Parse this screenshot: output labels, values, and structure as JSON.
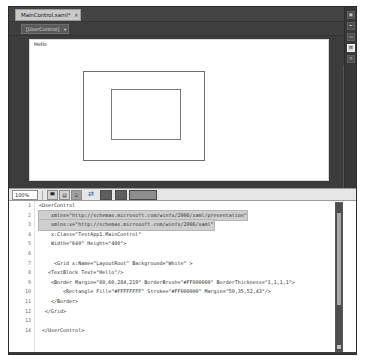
{
  "window": {
    "chrome_color": "#3c3c3c",
    "accent_color": "#1b5faa"
  },
  "tabstrip": {
    "tab_label": "MainControl.xaml*",
    "close_glyph": "✕"
  },
  "breadcrumb": {
    "root_label": "[UserControl]",
    "caret_glyph": "▾"
  },
  "designer": {
    "text_block_content": "Hello",
    "scroll_up_glyph": "▲",
    "scroll_down_glyph": "▼"
  },
  "rail": {
    "buttons": [
      {
        "name": "properties-icon",
        "glyph": "▣",
        "selected": false
      },
      {
        "name": "resources-icon",
        "glyph": "✒",
        "selected": false
      },
      {
        "name": "data-icon",
        "glyph": "▭",
        "selected": false
      },
      {
        "name": "assets-icon",
        "glyph": "⊞",
        "selected": true
      },
      {
        "name": "objects-icon",
        "glyph": "≡",
        "selected": false
      }
    ]
  },
  "splitbar": {
    "zoom_value": "100%",
    "design_button": "▀",
    "split_button": "▤",
    "code_button": "⌸",
    "swap_button": "⇄",
    "orientation_button": "▥"
  },
  "code": {
    "lines": [
      {
        "n": "1",
        "text": "<UserControl",
        "selected": false
      },
      {
        "n": "2",
        "text": "    xmlns=\"http://schemas.microsoft.com/winfx/2006/xaml/presentation\"",
        "selected": true
      },
      {
        "n": "3",
        "text": "    xmlns:x=\"http://schemas.microsoft.com/winfx/2006/xaml\"",
        "selected": true
      },
      {
        "n": "4",
        "text": "    x:Class=\"TestApp1.MainControl\"",
        "selected": false
      },
      {
        "n": "5",
        "text": "    Width=\"640\" Height=\"480\">",
        "selected": false
      },
      {
        "n": "6",
        "text": "",
        "selected": false
      },
      {
        "n": "7",
        "text": "     <Grid x:Name=\"LayoutRoot\" Background=\"White\" >",
        "selected": false
      },
      {
        "n": "8",
        "text": "   <TextBlock Text=\"Hello\"/>",
        "selected": false
      },
      {
        "n": "9",
        "text": "    <Border Margin=\"80,60,284,219\" BorderBrush=\"#FF000000\" BorderThickness=\"1,1,1,1\">",
        "selected": false
      },
      {
        "n": "10",
        "text": "        <Rectangle Fill=\"#FFFFFFFF\" Stroke=\"#FF000000\" Margin=\"59,35,52,43\"/>",
        "selected": false
      },
      {
        "n": "11",
        "text": "    </Border>",
        "selected": false
      },
      {
        "n": "12",
        "text": "  </Grid>",
        "selected": false
      },
      {
        "n": "13",
        "text": "",
        "selected": false
      },
      {
        "n": "14",
        "text": " </UserControl>",
        "selected": false
      }
    ]
  }
}
